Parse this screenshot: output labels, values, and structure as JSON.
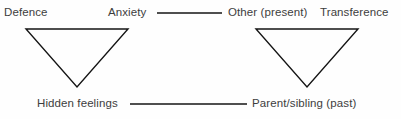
{
  "diagram": {
    "background_color": "#fefefe",
    "line_color": "#141414",
    "text_color": "#3d3d3d",
    "labels": {
      "defence": "Defence",
      "anxiety": "Anxiety",
      "other_present": "Other (present)",
      "transference": "Transference",
      "hidden_feelings": "Hidden feelings",
      "parent_sibling_past": "Parent/sibling (past)"
    },
    "shapes": [
      {
        "name": "left-triangle",
        "type": "inverted-triangle",
        "points": "26,29 128,29 77,87"
      },
      {
        "name": "right-triangle",
        "type": "inverted-triangle",
        "points": "256,29 358,29 307,87"
      }
    ],
    "connectors": [
      {
        "name": "top-connector",
        "from": "anxiety",
        "to": "other_present",
        "x1": 157,
        "y1": 13,
        "x2": 222,
        "y2": 13
      },
      {
        "name": "bottom-connector",
        "from": "hidden_feelings",
        "to": "parent_sibling_past",
        "x1": 130,
        "y1": 104,
        "x2": 247,
        "y2": 104
      }
    ]
  }
}
